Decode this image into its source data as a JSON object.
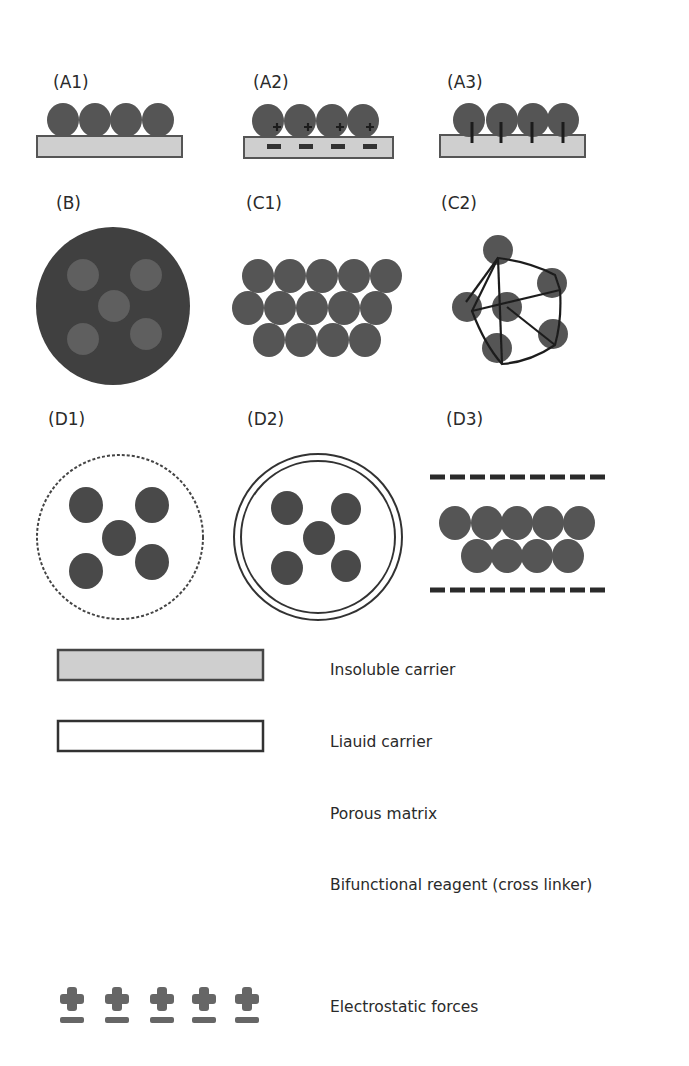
{
  "colors": {
    "enzyme": "#555555",
    "enzyme_light": "#6e6e6e",
    "carrier_fill": "#cfcfcf",
    "outline": "#444444",
    "text": "#2a2a2a",
    "background": "#ffffff"
  },
  "panels": [
    {
      "id": "A1",
      "label": "(A1)",
      "method": "adsorption on insoluble carrier"
    },
    {
      "id": "A2",
      "label": "(A2)",
      "method": "ionic binding via electrostatic forces"
    },
    {
      "id": "A3",
      "label": "(A3)",
      "method": "covalent binding to carrier"
    },
    {
      "id": "B",
      "label": "(B)",
      "method": "entrapment"
    },
    {
      "id": "C1",
      "label": "(C1)",
      "method": "cross-linked aggregates"
    },
    {
      "id": "C2",
      "label": "(C2)",
      "method": "cross-linking with bifunctional reagent"
    },
    {
      "id": "D1",
      "label": "(D1)",
      "method": "encapsulation in porous membrane"
    },
    {
      "id": "D2",
      "label": "(D2)",
      "method": "encapsulation in liquid membrane"
    },
    {
      "id": "D3",
      "label": "(D3)",
      "method": "confinement between porous matrices"
    }
  ],
  "legend": [
    {
      "symbol": "insoluble-carrier",
      "label": "Insoluble carrier"
    },
    {
      "symbol": "liquid-carrier",
      "label": "Liauid carrier"
    },
    {
      "symbol": "porous-matrix",
      "label": "Porous matrix"
    },
    {
      "symbol": "bifunctional-reagent",
      "label": "Bifunctional reagent (cross linker)"
    },
    {
      "symbol": "electrostatic-forces",
      "label": "Electrostatic forces"
    }
  ],
  "glyphs": {
    "plus": "+",
    "minus": "−"
  }
}
